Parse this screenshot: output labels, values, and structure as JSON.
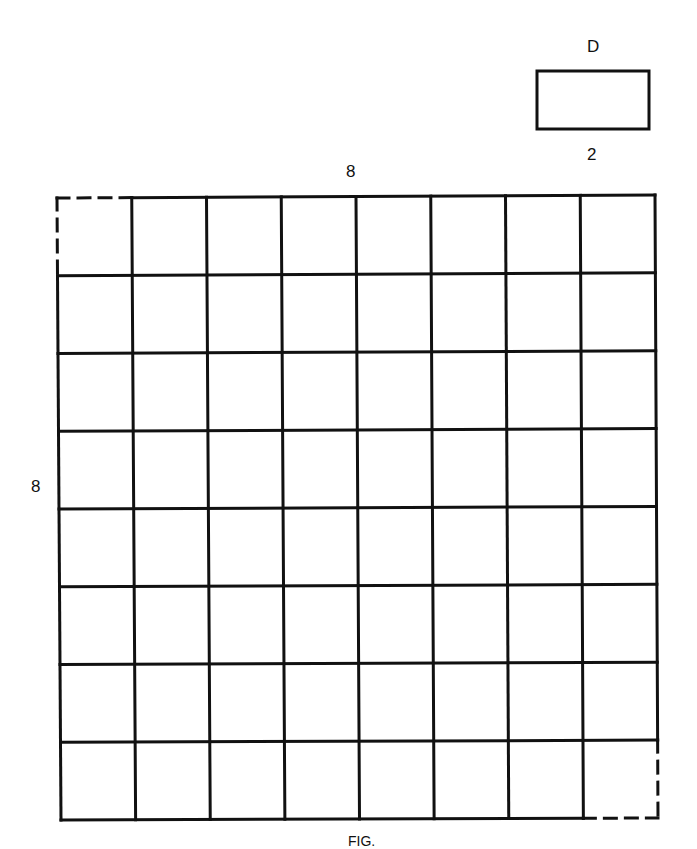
{
  "domino": {
    "label": "D",
    "length_label": "2",
    "box": {
      "x": 537,
      "y": 71,
      "w": 112,
      "h": 58
    }
  },
  "board": {
    "rows": 8,
    "cols": 8,
    "top_label": "8",
    "side_label": "8",
    "removed_corners": [
      "top-left",
      "bottom-right"
    ],
    "line_color": "#111111",
    "corners": {
      "tl": [
        57,
        198
      ],
      "tr": [
        655,
        195
      ],
      "br": [
        658,
        818
      ],
      "bl": [
        61,
        820
      ]
    }
  },
  "caption": {
    "text": "FIG."
  }
}
